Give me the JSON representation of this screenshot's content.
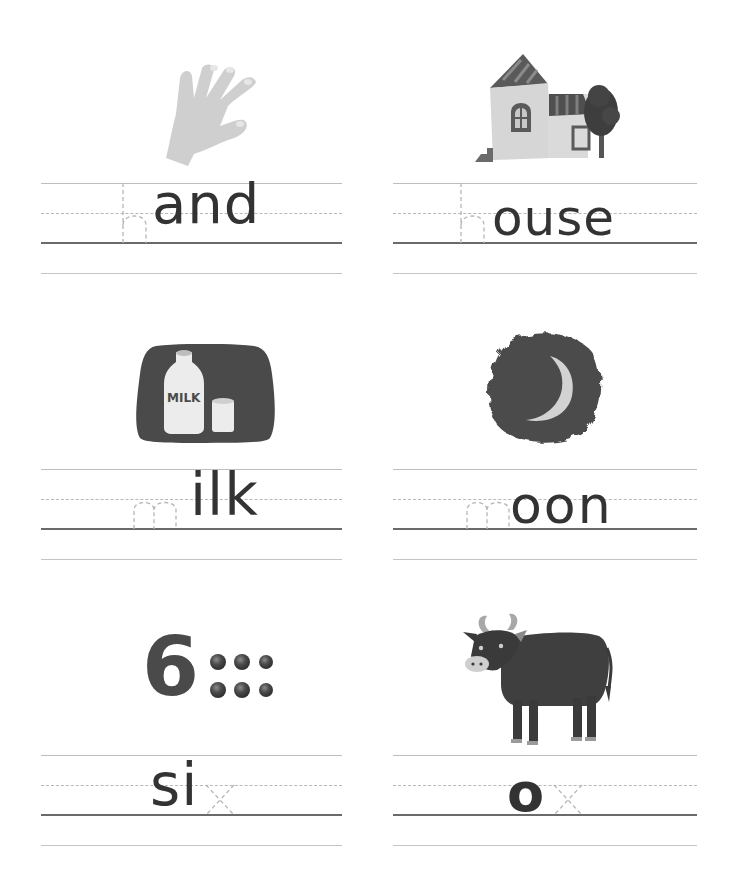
{
  "worksheet": {
    "cards": [
      {
        "id": "hand",
        "missing": "h",
        "shown": "and",
        "full_word": "hand",
        "picture": "hand-icon"
      },
      {
        "id": "house",
        "missing": "h",
        "shown": "ouse",
        "full_word": "house",
        "picture": "house-icon"
      },
      {
        "id": "milk",
        "missing": "m",
        "shown": "ilk",
        "full_word": "milk",
        "picture": "milk-icon",
        "label": "MILK"
      },
      {
        "id": "moon",
        "missing": "m",
        "shown": "oon",
        "full_word": "moon",
        "picture": "moon-icon"
      },
      {
        "id": "six",
        "missing": "x",
        "shown": "si",
        "full_word": "six",
        "picture": "six-dots-icon",
        "numeral": "6",
        "dot_count": 6
      },
      {
        "id": "ox",
        "missing": "x",
        "shown": "o",
        "full_word": "ox",
        "picture": "ox-icon"
      }
    ],
    "colors": {
      "ink": "#333333",
      "trace": "#b5b5b5",
      "guide_line": "#bdbdbd",
      "baseline": "#6a6a6a",
      "picture_dark": "#4a4a4a",
      "picture_light": "#d0d0d0"
    }
  }
}
